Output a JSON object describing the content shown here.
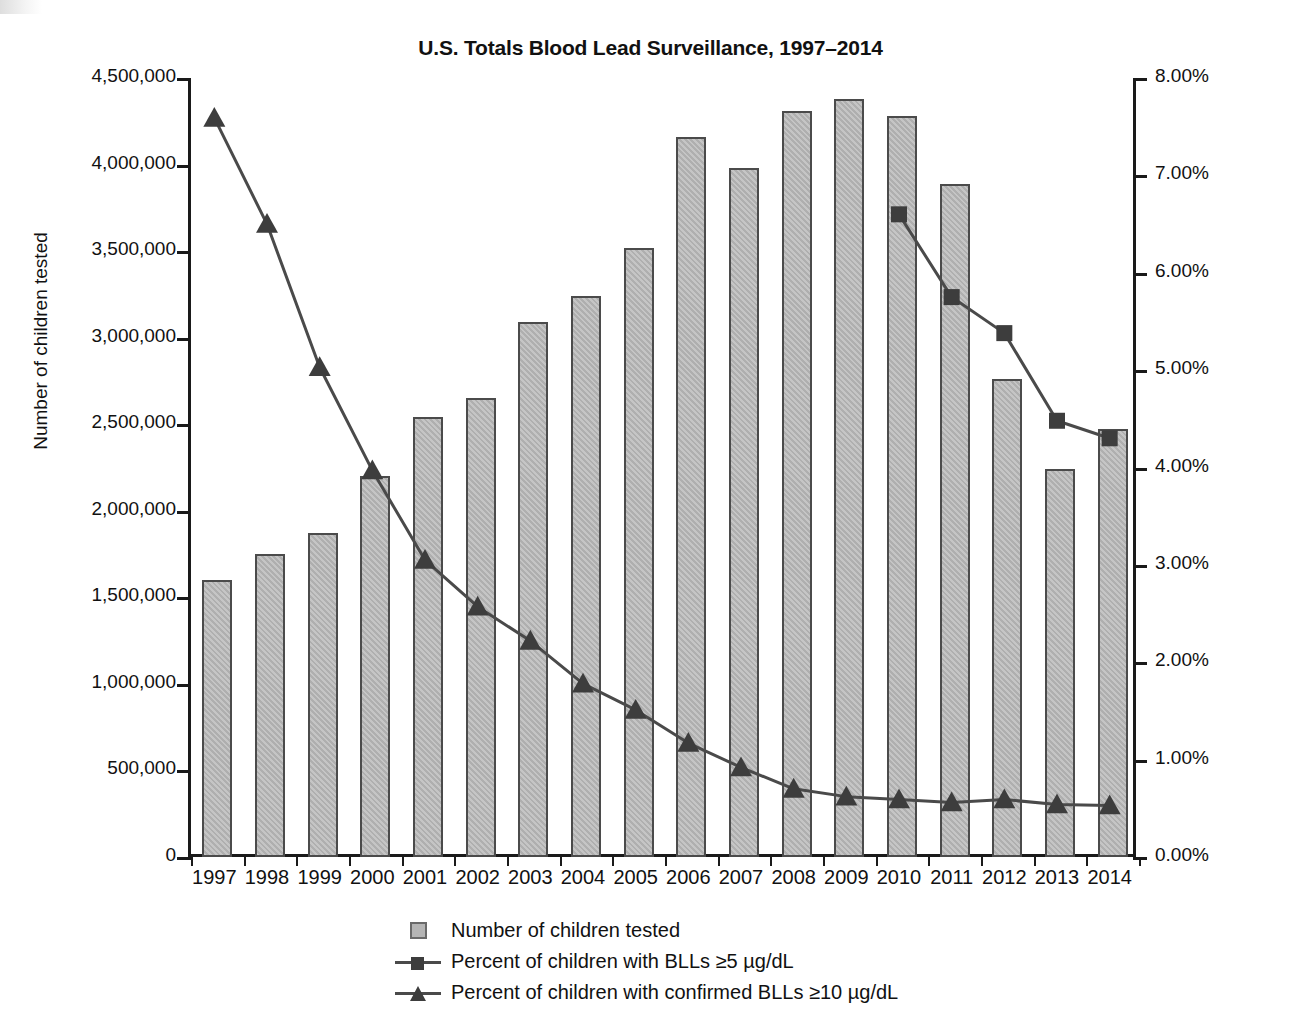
{
  "chart_data": {
    "type": "bar",
    "title": "U.S. Totals Blood Lead Surveillance, 1997–2014",
    "xlabel": "",
    "ylabel": "Number of children tested",
    "y2label": "BLLs as % children tested",
    "grid": false,
    "legend_position": "bottom-center",
    "categories": [
      "1997",
      "1998",
      "1999",
      "2000",
      "2001",
      "2002",
      "2003",
      "2004",
      "2005",
      "2006",
      "2007",
      "2008",
      "2009",
      "2010",
      "2011",
      "2012",
      "2013",
      "2014"
    ],
    "ylim": [
      0,
      4500000
    ],
    "y2lim": [
      0,
      8
    ],
    "yticks": [
      "0",
      "500,000",
      "1,000,000",
      "1,500,000",
      "2,000,000",
      "2,500,000",
      "3,000,000",
      "3,500,000",
      "4,000,000",
      "4,500,000"
    ],
    "ytick_values": [
      0,
      500000,
      1000000,
      1500000,
      2000000,
      2500000,
      3000000,
      3500000,
      4000000,
      4500000
    ],
    "y2ticks": [
      "0.00%",
      "1.00%",
      "2.00%",
      "3.00%",
      "4.00%",
      "5.00%",
      "6.00%",
      "7.00%",
      "8.00%"
    ],
    "y2tick_values": [
      0,
      1,
      2,
      3,
      4,
      5,
      6,
      7,
      8
    ],
    "series": [
      {
        "name": "Number of children tested",
        "type": "bar",
        "axis": "left",
        "color": "#b5b5b5",
        "values": [
          1600000,
          1750000,
          1870000,
          2200000,
          2540000,
          2650000,
          3090000,
          3240000,
          3520000,
          4160000,
          3980000,
          4310000,
          4380000,
          4280000,
          3890000,
          2760000,
          2240000,
          2470000
        ]
      },
      {
        "name": "Percent of children with BLLs ≥5 µg/dL",
        "type": "line",
        "marker": "square",
        "axis": "right",
        "color": "#4a4a4a",
        "values": [
          null,
          null,
          null,
          null,
          null,
          null,
          null,
          null,
          null,
          null,
          null,
          null,
          null,
          6.6,
          5.75,
          5.38,
          4.48,
          4.3
        ]
      },
      {
        "name": "Percent of children with confirmed BLLs ≥10 µg/dL",
        "type": "line",
        "marker": "triangle",
        "axis": "right",
        "color": "#4a4a4a",
        "values": [
          7.59,
          6.5,
          5.03,
          3.97,
          3.05,
          2.57,
          2.22,
          1.78,
          1.51,
          1.17,
          0.92,
          0.7,
          0.62,
          0.59,
          0.56,
          0.59,
          0.54,
          0.53
        ]
      }
    ]
  },
  "legend": {
    "items": [
      {
        "label": "Number of children tested",
        "key": "swatch"
      },
      {
        "label": "Percent of children with BLLs ≥5 µg/dL",
        "key": "line-square"
      },
      {
        "label": "Percent of children with confirmed BLLs ≥10 µg/dL",
        "key": "line-triangle"
      }
    ]
  }
}
